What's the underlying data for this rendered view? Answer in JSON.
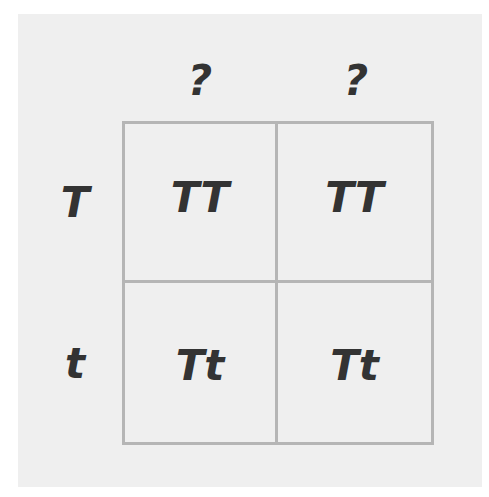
{
  "diagram": {
    "type": "punnett-square",
    "column_headers": [
      "?",
      "?"
    ],
    "row_headers": [
      "T",
      "t"
    ],
    "cells": [
      [
        "TT",
        "TT"
      ],
      [
        "Tt",
        "Tt"
      ]
    ],
    "colors": {
      "background": "#efefef",
      "grid_lines": "#b5b5b5",
      "text": "#333333"
    }
  }
}
